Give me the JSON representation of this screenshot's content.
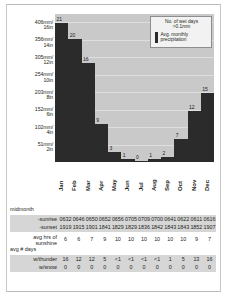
{
  "chart_data": {
    "type": "bar",
    "title": "",
    "xlabel": "",
    "ylabel": "",
    "categories": [
      "Jan",
      "Feb",
      "Mar",
      "Apr",
      "May",
      "Jun",
      "Jul",
      "Aug",
      "Sep",
      "Oct",
      "Nov",
      "Dec"
    ],
    "values": [
      21,
      20,
      16,
      9,
      3,
      1,
      0,
      1,
      2,
      7,
      12,
      15
    ],
    "value_labels": [
      "21",
      "20",
      "16",
      "9",
      "3",
      "1",
      "0",
      "1",
      "2",
      "7",
      "12",
      "15"
    ],
    "bar_heights_mm": [
      406,
      360,
      290,
      110,
      28,
      8,
      2,
      8,
      16,
      66,
      150,
      200
    ],
    "ylim": [
      0,
      432
    ],
    "grid": true,
    "y_ticks": [
      {
        "mm": "51mm/",
        "in": "2in"
      },
      {
        "mm": "102mm/",
        "in": "4in"
      },
      {
        "mm": "152mm/",
        "in": "6in"
      },
      {
        "mm": "203mm/",
        "in": "8in"
      },
      {
        "mm": "254mm/",
        "in": "10in"
      },
      {
        "mm": "305mm/",
        "in": "12in"
      },
      {
        "mm": "356mm/",
        "in": "14in"
      },
      {
        "mm": "406mm/",
        "in": "16in"
      }
    ],
    "legend": {
      "position": "top-right",
      "wet_days_label": "No. of wet days >0.1mm",
      "wet_days_line1": "No. of wet days",
      "wet_days_line2": ">0.1mm",
      "precip_line1": "Avg. monthly",
      "precip_line2": "precipitation",
      "precip_color": "#2b2b2b"
    }
  },
  "table": {
    "group1_header": "midmonth",
    "rows": [
      {
        "label": "-sunrise",
        "values": [
          "0632",
          "0646",
          "0650",
          "0652",
          "0656",
          "0705",
          "0709",
          "0700",
          "0641",
          "0622",
          "0611",
          "0616"
        ]
      },
      {
        "label": "-sunset",
        "values": [
          "1919",
          "1915",
          "1901",
          "1841",
          "1829",
          "1829",
          "1836",
          "1842",
          "1843",
          "1843",
          "1852",
          "1907"
        ]
      }
    ],
    "sunshine": {
      "label_line1": "avg hrs of",
      "label_line2": "sunshine",
      "values": [
        "6",
        "6",
        "7",
        "9",
        "10",
        "10",
        "10",
        "10",
        "10",
        "10",
        "9",
        "7"
      ]
    },
    "days_header_line1": "avg # days",
    "thunder": {
      "label": "w/thunder",
      "values": [
        "16",
        "12",
        "12",
        "5",
        "<1",
        "<1",
        "<1",
        "<1",
        "1",
        "5",
        "13",
        "16"
      ]
    },
    "snow": {
      "label": "w/snow",
      "values": [
        "0",
        "0",
        "0",
        "0",
        "0",
        "0",
        "0",
        "0",
        "0",
        "0",
        "0",
        "0"
      ]
    }
  },
  "colors": {
    "bar": "#2b2b2b",
    "plot_bg": "#c9c9c9",
    "grid": "#dedede",
    "row_shade": "#d6d6d6",
    "text": "#231f20"
  }
}
